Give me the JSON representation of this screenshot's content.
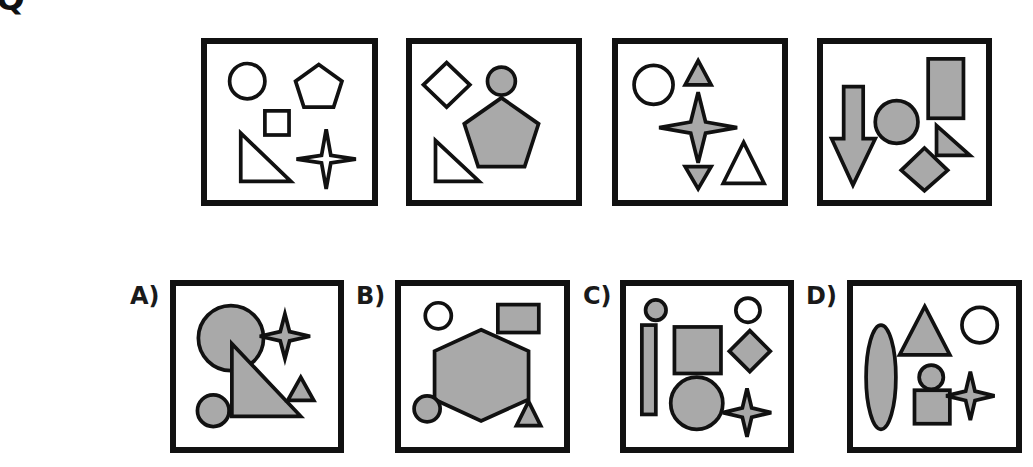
{
  "question": {
    "number_fragment": "Q",
    "colors": {
      "stroke": "#111111",
      "fill_gray": "#a9a9a9",
      "fill_white": "#ffffff"
    },
    "sequence": [
      {
        "id": "seq-1",
        "shapes": [
          "circle (outline)",
          "pentagon (outline)",
          "square (outline)",
          "right triangle (outline)",
          "four-point star (outline)"
        ]
      },
      {
        "id": "seq-2",
        "shapes": [
          "diamond (outline)",
          "circle (gray)",
          "pentagon (gray)",
          "right triangle (outline)"
        ]
      },
      {
        "id": "seq-3",
        "shapes": [
          "circle (outline)",
          "triangle up (gray)",
          "four-point star (gray)",
          "triangle down (gray)",
          "triangle (outline)"
        ]
      },
      {
        "id": "seq-4",
        "shapes": [
          "down arrow (gray)",
          "circle (gray)",
          "rectangle (gray)",
          "right triangle (gray)",
          "diamond (gray)"
        ]
      }
    ],
    "options": [
      {
        "label": "A)",
        "shapes": [
          "large circle (gray)",
          "four-point star (gray)",
          "right triangle (gray)",
          "small triangle (gray)",
          "small circle (gray)"
        ]
      },
      {
        "label": "B)",
        "shapes": [
          "circle (outline)",
          "rectangle (gray)",
          "hexagon (gray)",
          "small circle (gray)",
          "triangle (gray)"
        ]
      },
      {
        "label": "C)",
        "shapes": [
          "small circle (gray)",
          "tall bar (gray)",
          "circle (outline)",
          "square (gray)",
          "diamond (gray)",
          "large circle (gray)",
          "four-point star (gray)"
        ]
      },
      {
        "label": "D)",
        "shapes": [
          "ellipse (gray)",
          "triangle (gray)",
          "circle (outline)",
          "small circle (gray)",
          "square (gray)",
          "four-point star (gray)"
        ]
      }
    ]
  }
}
